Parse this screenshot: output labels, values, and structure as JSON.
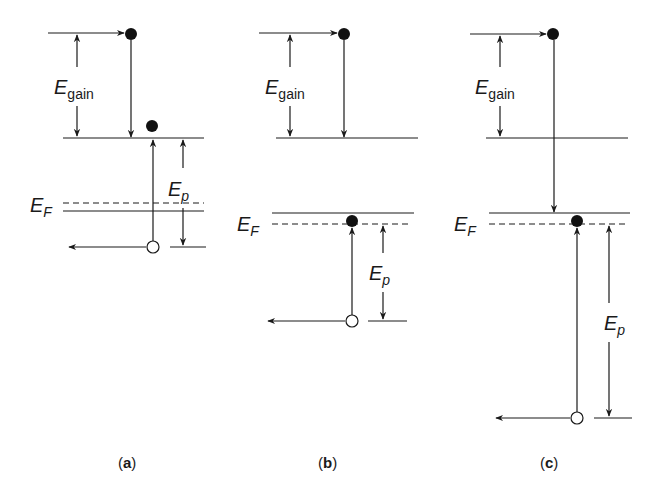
{
  "figure": {
    "panels": [
      {
        "id": "a",
        "caption_open": "(",
        "caption_letter": "a",
        "caption_close": ")",
        "gain_symbol": "E",
        "gain_subscript": "gain",
        "fermi_symbol": "E",
        "fermi_subscript": "F",
        "p_symbol": "E",
        "p_subscript": "p",
        "description": "Fermi level lies below the lower conduction level; hole deep below"
      },
      {
        "id": "b",
        "caption_open": "(",
        "caption_letter": "b",
        "caption_close": ")",
        "gain_symbol": "E",
        "gain_subscript": "gain",
        "fermi_symbol": "E",
        "fermi_subscript": "F",
        "p_symbol": "E",
        "p_subscript": "p",
        "description": "Fermi level just below upper band edge; electron at Fermi level"
      },
      {
        "id": "c",
        "caption_open": "(",
        "caption_letter": "c",
        "caption_close": ")",
        "gain_symbol": "E",
        "gain_subscript": "gain",
        "fermi_symbol": "E",
        "fermi_subscript": "F",
        "p_symbol": "E",
        "p_subscript": "p",
        "description": "Electron falls past gain level to Fermi level; large Ep"
      }
    ],
    "colors": {
      "ink": "#1a1a1a",
      "background": "#ffffff"
    }
  }
}
